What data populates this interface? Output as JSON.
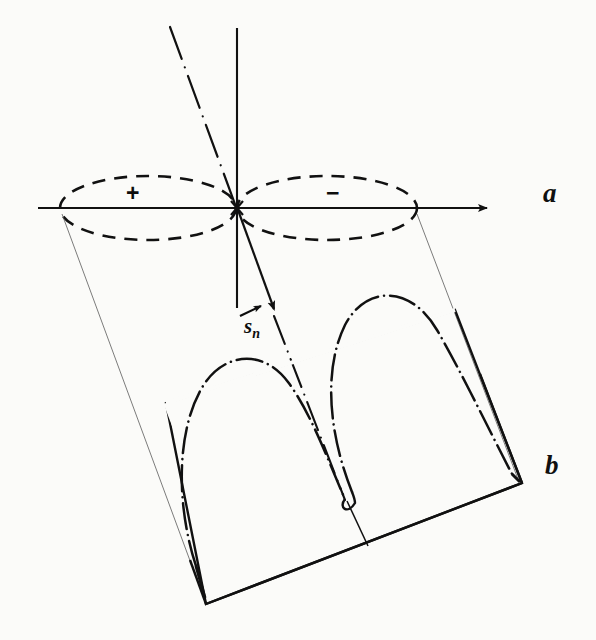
{
  "figure": {
    "background_color": "#fbfbf9",
    "ink_color": "#111111",
    "panels": [
      {
        "id": "a",
        "label": "a",
        "description": "plane view with two dashed lobes marked plus and minus about the origin"
      },
      {
        "id": "b",
        "label": "b",
        "description": "perspective view of two dash-dot lobes standing on a tilted quadrilateral ground plane"
      }
    ],
    "annotations": {
      "sign_positive": "+",
      "sign_negative": "−",
      "vector_symbol": "s",
      "vector_subscript": "n",
      "vector_full": "s⃗ₙ"
    },
    "elements": {
      "horizontal_axis": "arrowed horizontal axis through origin pointing right",
      "vertical_axis": "plain vertical axis through origin",
      "oblique_axis": "dash-dot oblique axis through origin with arrowhead below origin",
      "left_lobe_plane": "dashed ellipse left of origin",
      "right_lobe_plane": "dashed ellipse right of origin",
      "left_lobe_solid": "dash-dot closed lobe rising from the ground plane at left",
      "right_lobe_solid": "dash-dot closed lobe rising from the ground plane at right",
      "ground_plane": "tilted quadrilateral base",
      "projection_lines": "thin construction lines linking the plane lobes to the perspective lobes"
    }
  }
}
